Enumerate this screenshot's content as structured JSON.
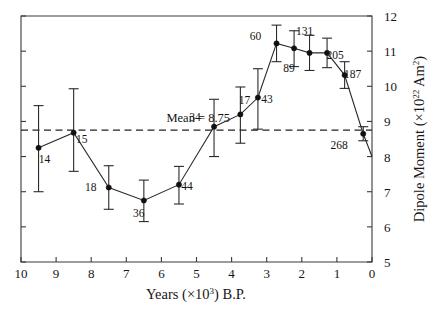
{
  "figure": {
    "name": "geomagnetic-dipole-moment-vs-years-bp"
  },
  "chart_data": {
    "type": "line",
    "title": "",
    "subtitle": "",
    "xlabel_parts": {
      "main": "Years (×10",
      "sup": "3",
      "tail": ") B.P."
    },
    "xlabel": "Years (×10^3) B.P.",
    "ylabel_parts": {
      "main": "Dipole Moment (×10",
      "sup": "22",
      "tail": " Am",
      "sup2": "2",
      "tail2": ")"
    },
    "ylabel": "Dipole Moment (×10^22 Am^2)",
    "xlim": [
      10,
      0
    ],
    "ylim": [
      5,
      12
    ],
    "x_ticks": [
      10,
      9,
      8,
      7,
      6,
      5,
      4,
      3,
      2,
      1,
      0
    ],
    "y_ticks": [
      5,
      6,
      7,
      8,
      9,
      10,
      11,
      12
    ],
    "x_tick_labels": [
      "10",
      "9",
      "8",
      "7",
      "6",
      "5",
      "4",
      "3",
      "2",
      "1",
      "0"
    ],
    "y_tick_labels": [
      "5",
      "6",
      "7",
      "8",
      "9",
      "10",
      "11",
      "12"
    ],
    "x_axis_reversed": true,
    "y_axis_side": "right",
    "grid": false,
    "legend": null,
    "annotations": [
      {
        "name": "mean-annotation",
        "text": "Mean = 8.75",
        "value": 8.75,
        "type": "horizontal-dashed-line",
        "label_x": 4.95,
        "label_y": 8.98
      }
    ],
    "series": [
      {
        "name": "Archeomagnetic dipole moment",
        "marker": "filled-circle",
        "points": [
          {
            "id": "14",
            "x": 9.5,
            "y": 8.25,
            "err_low": 1.25,
            "err_high": 1.2,
            "label": "14",
            "label_dx": 6,
            "label_dy": 15
          },
          {
            "id": "15",
            "x": 8.5,
            "y": 8.68,
            "err_low": 1.1,
            "err_high": 1.25,
            "label": "15",
            "label_dx": 8,
            "label_dy": 10
          },
          {
            "id": "18",
            "x": 7.5,
            "y": 7.12,
            "err_low": 0.62,
            "err_high": 0.62,
            "label": "18",
            "label_dx": -18,
            "label_dy": 4
          },
          {
            "id": "36",
            "x": 6.5,
            "y": 6.75,
            "err_low": 0.6,
            "err_high": 0.58,
            "label": "36",
            "label_dx": -5,
            "label_dy": 16
          },
          {
            "id": "44",
            "x": 5.5,
            "y": 7.2,
            "err_low": 0.55,
            "err_high": 0.52,
            "label": "44",
            "label_dx": 8,
            "label_dy": 5
          },
          {
            "id": "34",
            "x": 4.5,
            "y": 8.85,
            "err_low": 0.85,
            "err_high": 0.78,
            "label": "34",
            "label_dx": -19,
            "label_dy": -6
          },
          {
            "id": "17",
            "x": 3.75,
            "y": 9.2,
            "err_low": 0.82,
            "err_high": 0.78,
            "label": "17",
            "label_dx": 4,
            "label_dy": -10
          },
          {
            "id": "43",
            "x": 3.25,
            "y": 9.68,
            "err_low": 0.9,
            "err_high": 0.82,
            "label": "43",
            "label_dx": 9,
            "label_dy": 5
          },
          {
            "id": "60",
            "x": 2.72,
            "y": 11.22,
            "err_low": 0.52,
            "err_high": 0.52,
            "label": "60",
            "label_dx": -21,
            "label_dy": -3
          },
          {
            "id": "89",
            "x": 2.22,
            "y": 11.08,
            "err_low": 0.52,
            "err_high": 0.5,
            "label": "89",
            "label_dx": -5,
            "label_dy": 24
          },
          {
            "id": "131",
            "x": 1.78,
            "y": 10.95,
            "err_low": 0.5,
            "err_high": 0.5,
            "label": "131",
            "label_dx": -5,
            "label_dy": -18
          },
          {
            "id": "205",
            "x": 1.28,
            "y": 10.95,
            "err_low": 0.42,
            "err_high": 0.42,
            "label": "205",
            "label_dx": 8,
            "label_dy": 6
          },
          {
            "id": "187",
            "x": 0.78,
            "y": 10.32,
            "err_low": 0.38,
            "err_high": 0.38,
            "label": "187",
            "label_dx": 8,
            "label_dy": 3
          },
          {
            "id": "268",
            "x": 0.25,
            "y": 8.65,
            "err_low": 0.2,
            "err_high": 0.2,
            "label": "268",
            "label_dx": -24,
            "label_dy": 15
          },
          {
            "id": "end",
            "x": 0.0,
            "y": 8.0,
            "err_low": 0,
            "err_high": 0,
            "label": "",
            "label_dx": 0,
            "label_dy": 0
          }
        ]
      }
    ]
  }
}
